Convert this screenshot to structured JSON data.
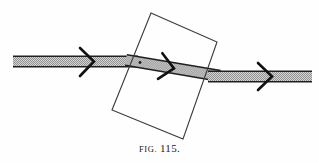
{
  "figure": {
    "caption_prefix": "FIG.",
    "caption_number": "115.",
    "title_full": "FIG. 115.",
    "background_color": "#fefefe",
    "line_color": "#1a1a1a",
    "band_fill_color": "#c9c9c9",
    "band_hatch_color": "#8f8f8f",
    "slab_stroke_color": "#3a3a3a",
    "arrow_color": "#111111",
    "elements": {
      "incident_band": {
        "name": "incident-beam-band",
        "label": "incident beam",
        "x_start": 13,
        "x_end": 132,
        "y_top": 56,
        "y_bottom": 67,
        "angle_deg": 0
      },
      "refracted_band": {
        "name": "refracted-beam-band",
        "label": "refracted beam inside slab",
        "x_start": 126,
        "x_end": 216,
        "y_start": 60,
        "y_end": 76,
        "thickness": 11,
        "angle_deg": 9.5
      },
      "emergent_band": {
        "name": "emergent-beam-band",
        "label": "emergent beam",
        "x_start": 210,
        "x_end": 312,
        "y_top": 71,
        "y_bottom": 82,
        "angle_deg": 0
      },
      "slab": {
        "name": "glass-slab-rectangle",
        "label": "rectangular glass slab",
        "corners": [
          {
            "x": 151,
            "y": 13
          },
          {
            "x": 217,
            "y": 42
          },
          {
            "x": 183,
            "y": 139
          },
          {
            "x": 112,
            "y": 110
          }
        ]
      },
      "arrows": [
        {
          "name": "arrow-incident",
          "x": 88,
          "y": 61,
          "angle_deg": 0,
          "size": 13
        },
        {
          "name": "arrow-refracted",
          "x": 172,
          "y": 68,
          "angle_deg": 9.5,
          "size": 13
        },
        {
          "name": "arrow-emergent",
          "x": 266,
          "y": 76,
          "angle_deg": 0,
          "size": 13
        }
      ],
      "entry_point": {
        "name": "entry-point-dot",
        "label": "point of incidence",
        "x": 140,
        "y": 63,
        "radius": 1.5
      }
    }
  }
}
